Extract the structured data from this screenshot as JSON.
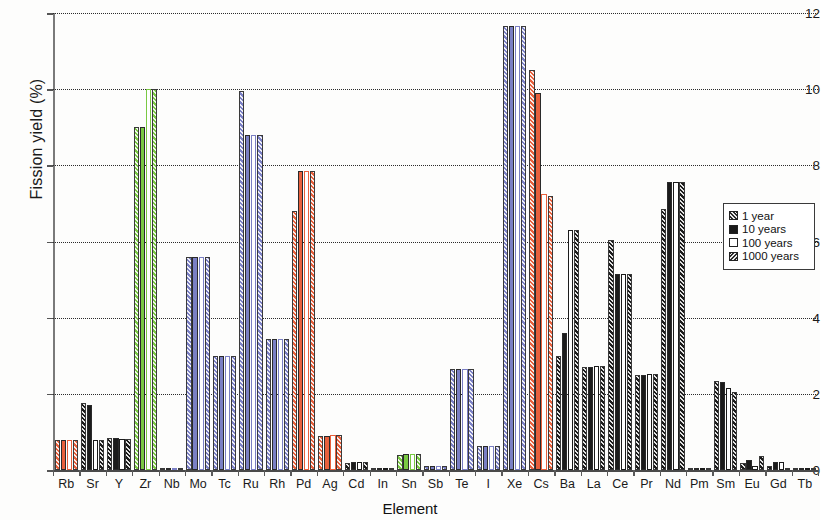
{
  "chart_data": {
    "type": "bar",
    "title": "",
    "xlabel": "Element",
    "ylabel": "Fission yield (%)",
    "ylim": [
      0,
      12
    ],
    "yticks": [
      0,
      2,
      4,
      6,
      8,
      10,
      12
    ],
    "grid": true,
    "legend_position": "right-inside",
    "categories": [
      "Rb",
      "Sr",
      "Y",
      "Zr",
      "Nb",
      "Mo",
      "Tc",
      "Ru",
      "Rh",
      "Pd",
      "Ag",
      "Cd",
      "In",
      "Sn",
      "Sb",
      "Te",
      "I",
      "Xe",
      "Cs",
      "Ba",
      "La",
      "Ce",
      "Pr",
      "Nd",
      "Pm",
      "Sm",
      "Eu",
      "Gd",
      "Tb"
    ],
    "series": [
      {
        "name": "1 year",
        "pattern": "hatch",
        "values": [
          0.8,
          1.75,
          0.85,
          9.0,
          0.02,
          5.6,
          3.0,
          9.95,
          3.45,
          6.8,
          0.9,
          0.18,
          0.03,
          0.4,
          0.1,
          2.65,
          0.62,
          11.65,
          10.5,
          3.0,
          2.7,
          6.05,
          2.5,
          6.85,
          0.0,
          2.35,
          0.18,
          0.1,
          0.02
        ]
      },
      {
        "name": "10 years",
        "pattern": "solid",
        "values": [
          0.8,
          1.72,
          0.85,
          9.0,
          0.02,
          5.6,
          3.0,
          8.8,
          3.45,
          7.85,
          0.9,
          0.2,
          0.03,
          0.42,
          0.1,
          2.65,
          0.62,
          11.65,
          9.9,
          3.6,
          2.7,
          5.15,
          2.5,
          7.55,
          0.0,
          2.3,
          0.25,
          0.2,
          0.02
        ]
      },
      {
        "name": "100 years",
        "pattern": "empty",
        "values": [
          0.8,
          0.8,
          0.82,
          10.0,
          0.02,
          5.6,
          3.0,
          8.8,
          3.45,
          7.85,
          0.92,
          0.2,
          0.03,
          0.42,
          0.1,
          2.65,
          0.62,
          11.65,
          7.25,
          6.3,
          2.72,
          5.15,
          2.52,
          7.55,
          0.0,
          2.15,
          0.1,
          0.2,
          0.02
        ]
      },
      {
        "name": "1000 years",
        "pattern": "hatch",
        "values": [
          0.8,
          0.8,
          0.82,
          10.0,
          0.02,
          5.6,
          3.0,
          8.8,
          3.45,
          7.85,
          0.92,
          0.2,
          0.03,
          0.42,
          0.1,
          2.65,
          0.62,
          11.65,
          7.2,
          6.3,
          2.72,
          5.15,
          2.52,
          7.55,
          0.0,
          2.05,
          0.38,
          0.05,
          0.02
        ]
      }
    ],
    "category_colors": {
      "Rb": "#e8603c",
      "Sr": "#1b1b1b",
      "Y": "#1b1b1b",
      "Zr": "#7ac943",
      "Nb": "#7a7fc4",
      "Mo": "#7a7fc4",
      "Tc": "#7a7fc4",
      "Ru": "#7a7fc4",
      "Rh": "#7a7fc4",
      "Pd": "#e8603c",
      "Ag": "#e8603c",
      "Cd": "#1b1b1b",
      "In": "#1b1b1b",
      "Sn": "#7ac943",
      "Sb": "#7a7fc4",
      "Te": "#7a7fc4",
      "I": "#7a7fc4",
      "Xe": "#7a7fc4",
      "Cs": "#e8603c",
      "Ba": "#1b1b1b",
      "La": "#1b1b1b",
      "Ce": "#1b1b1b",
      "Pr": "#1b1b1b",
      "Nd": "#1b1b1b",
      "Pm": "#1b1b1b",
      "Sm": "#1b1b1b",
      "Eu": "#1b1b1b",
      "Gd": "#1b1b1b",
      "Tb": "#1b1b1b"
    }
  },
  "legend": {
    "entries": [
      {
        "label": "1 year",
        "swatch": "sw-hatch"
      },
      {
        "label": "10 years",
        "swatch": "sw-solid"
      },
      {
        "label": "100 years",
        "swatch": "sw-empty"
      },
      {
        "label": "1000 years",
        "swatch": "sw-hatch2"
      }
    ]
  },
  "axes": {
    "y_title": "Fission yield (%)",
    "x_title": "Element"
  }
}
